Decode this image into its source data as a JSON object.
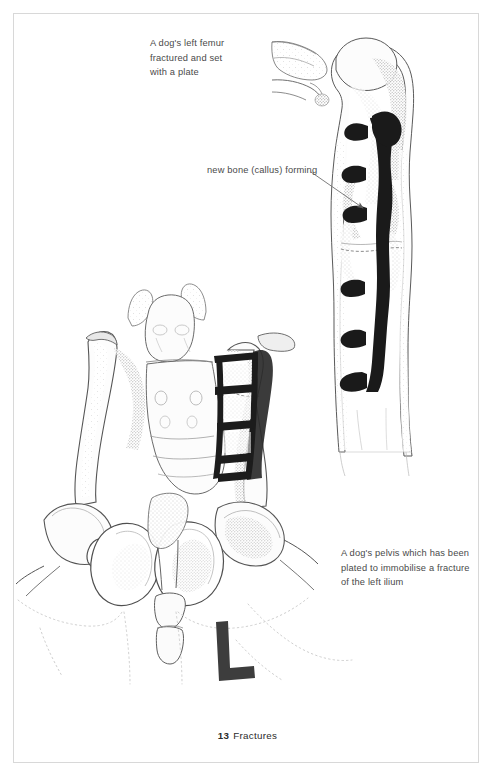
{
  "page": {
    "background_color": "#ffffff",
    "border_color": "#d8d8d8",
    "footer": {
      "page_number": "13",
      "chapter_title": "Fractures"
    }
  },
  "figures": [
    {
      "id": "femur-radiograph",
      "caption": "A dog's left femur\nfractured and set\nwith a plate",
      "annotation": {
        "label": "new bone (callus) forming",
        "arrow_from": [
          310,
          172
        ],
        "arrow_to": [
          366,
          211
        ]
      },
      "subject": "dog left femur",
      "implant": "bone plate with screws",
      "implant_color": "#1c1c1c",
      "bone_outline_color": "#4a4a4a",
      "bone_fill_color": "#fdfdfd"
    },
    {
      "id": "pelvis-radiograph",
      "caption": "A dog's pelvis which has been\nplated to immobilise a fracture\nof the left ilium",
      "subject": "dog pelvis",
      "implant": "bone plate with screws on left ilium",
      "implant_color": "#1c1c1c",
      "marker": "L",
      "bone_outline_color": "#4a4a4a",
      "bone_fill_color": "#fdfdfd"
    }
  ],
  "captions": {
    "femur": "A dog's left femur\nfractured and set\nwith a plate",
    "callus": "new bone (callus) forming",
    "pelvis": "A dog's pelvis which has been\nplated to immobilise a fracture\nof the left ilium"
  },
  "marker": {
    "left_side_label": "L"
  }
}
